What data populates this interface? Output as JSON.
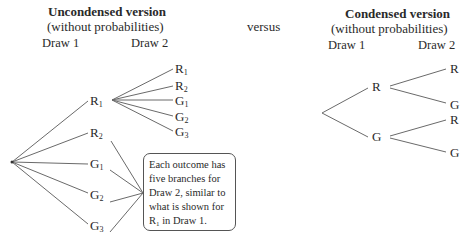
{
  "left": {
    "title": "Uncondensed version",
    "subtitle": "(without probabilities)",
    "col1": "Draw 1",
    "col2": "Draw 2",
    "draw1_nodes": [
      {
        "letter": "R",
        "sub": "1"
      },
      {
        "letter": "R",
        "sub": "2"
      },
      {
        "letter": "G",
        "sub": "1"
      },
      {
        "letter": "G",
        "sub": "2"
      },
      {
        "letter": "G",
        "sub": "3"
      }
    ],
    "draw2_nodes_under_R1": [
      {
        "letter": "R",
        "sub": "1"
      },
      {
        "letter": "R",
        "sub": "2"
      },
      {
        "letter": "G",
        "sub": "1"
      },
      {
        "letter": "G",
        "sub": "2"
      },
      {
        "letter": "G",
        "sub": "3"
      }
    ],
    "callout": {
      "line1": "Each outcome has",
      "line2": "five branches for",
      "line3": "Draw 2, similar to",
      "line4": "what is shown for",
      "line5_letter": "R",
      "line5_sub": "1",
      "line5_rest": " in Draw 1."
    }
  },
  "middle": {
    "label": "versus"
  },
  "right": {
    "title": "Condensed version",
    "subtitle": "(without probabilities)",
    "col1": "Draw 1",
    "col2": "Draw 2",
    "draw1_nodes": [
      "R",
      "G"
    ],
    "draw2_nodes": [
      "R",
      "G",
      "R",
      "G"
    ]
  },
  "colors": {
    "line": "#6a6a6a",
    "text": "#2a2a2a",
    "callout_border": "#555555"
  }
}
